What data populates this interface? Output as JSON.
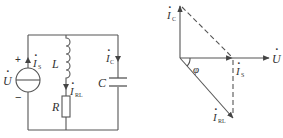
{
  "colors": {
    "stroke": "#444444",
    "text": "#333333",
    "background": "#ffffff"
  },
  "circuit": {
    "source": {
      "symbol": "U",
      "dot": "·",
      "plus": "+",
      "minus": "−",
      "current": "I",
      "current_sub": "S"
    },
    "inductor": {
      "label": "L"
    },
    "resistor": {
      "label": "R",
      "current": "I",
      "current_sub": "RL"
    },
    "capacitor": {
      "label": "C",
      "current": "I",
      "current_sub": "C"
    }
  },
  "phasor": {
    "ic": {
      "label": "I",
      "sub": "C"
    },
    "is": {
      "label": "I",
      "sub": "S"
    },
    "irl": {
      "label": "I",
      "sub": "RL"
    },
    "u": {
      "label": "U"
    },
    "angle": {
      "label": "φ"
    },
    "dot": "·"
  }
}
